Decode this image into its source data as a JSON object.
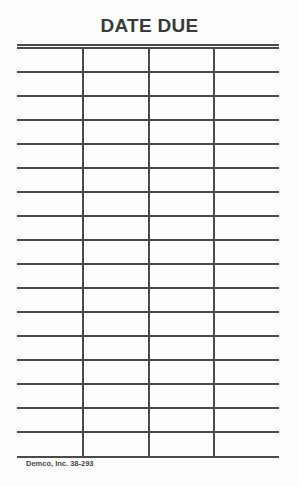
{
  "card": {
    "title": "DATE DUE",
    "footer": "Demco, Inc. 38-293",
    "columns": 4,
    "rows": 17,
    "line_color": "#4a4a4a",
    "text_color": "#3a3a3a"
  }
}
